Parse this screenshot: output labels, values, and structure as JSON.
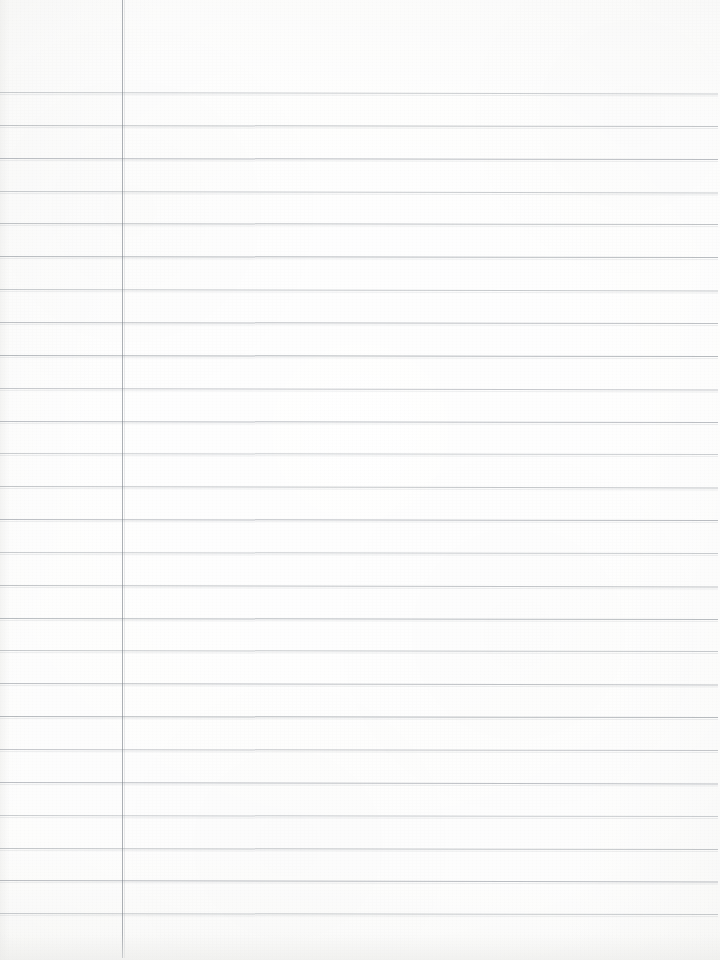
{
  "document": {
    "kind": "blank-ruled-notebook-page",
    "title": "Blank Lined Notebook Page",
    "page_width": 720,
    "page_height": 960,
    "paper_color": "#fbfbfa",
    "has_text": false,
    "text_content": ""
  },
  "ruling": {
    "line_color": "#80868e",
    "line_thickness_px": 1,
    "first_line_y": 92,
    "line_spacing_px": 32.84,
    "line_count": 26,
    "line_left_x": 0,
    "line_right_x": 718,
    "slant_deg": 0.12,
    "line_y_positions": [
      92,
      124.8,
      157.7,
      190.5,
      223.4,
      256.2,
      289.1,
      321.9,
      354.8,
      387.6,
      420.5,
      453.3,
      486.2,
      519.0,
      551.9,
      584.7,
      617.6,
      650.4,
      683.3,
      716.1,
      749.0,
      781.8,
      814.7,
      847.5,
      880.4,
      913.2
    ]
  },
  "margin_rule": {
    "orientation": "vertical",
    "color": "#787e86",
    "thickness_px": 1,
    "x": 122,
    "top_y": 0,
    "bottom_y": 958
  },
  "edges": {
    "left_band_width_px": 14,
    "bottom_shadow_height_px": 26
  }
}
